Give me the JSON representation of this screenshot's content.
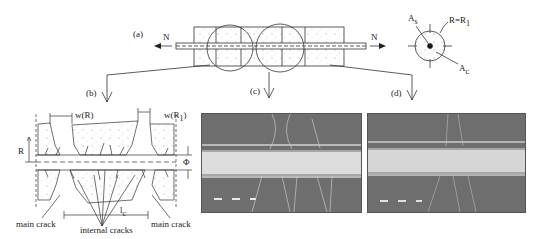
{
  "figure": {
    "panels": {
      "a": {
        "label": "(a)",
        "force_left": "N",
        "force_right": "N"
      },
      "b": {
        "label": "(b)"
      },
      "c": {
        "label": "(c)"
      },
      "d": {
        "label": "(d)"
      }
    },
    "cross_section": {
      "label_As": "A",
      "label_As_sub": "s",
      "label_R": "R=R",
      "label_R_sub": "1",
      "label_Ac": "A",
      "label_Ac_sub": "c"
    },
    "detail_b": {
      "w_R": "w(R)",
      "w_R1": "w(R",
      "w_R1_sub": "1",
      "w_R1_close": ")",
      "R": "R",
      "phi": "Φ",
      "lc": "l",
      "lc_sub": "c",
      "main_crack_left": "main crack",
      "main_crack_right": "main crack",
      "internal_cracks": "internal cracks"
    },
    "colors": {
      "line": "#333333",
      "concrete_dots": "#777777",
      "photo_bg": "#6e6e6e",
      "photo_bar": "#d8d8d8",
      "photo_bar_edge": "#a8a8a8"
    }
  }
}
